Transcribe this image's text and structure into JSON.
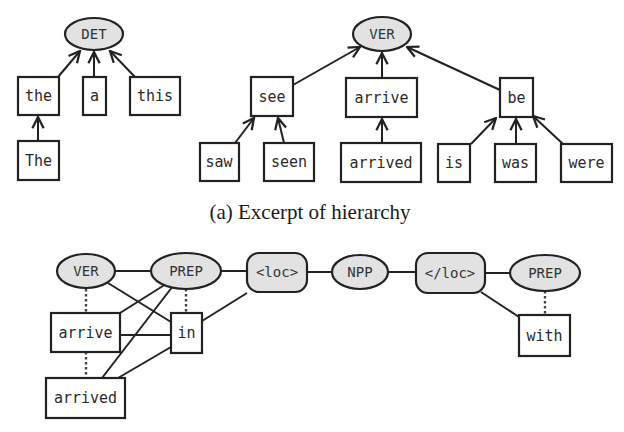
{
  "figure": {
    "part_a": {
      "caption": "(a) Excerpt of hierarchy",
      "categories": [
        {
          "label": "DET",
          "children": [
            {
              "label": "the",
              "children": [
                {
                  "label": "The"
                }
              ]
            },
            {
              "label": "a",
              "children": []
            },
            {
              "label": "this",
              "children": []
            }
          ]
        },
        {
          "label": "VER",
          "children": [
            {
              "label": "see",
              "children": [
                {
                  "label": "saw"
                },
                {
                  "label": "seen"
                }
              ]
            },
            {
              "label": "arrive",
              "children": [
                {
                  "label": "arrived"
                }
              ]
            },
            {
              "label": "be",
              "children": [
                {
                  "label": "is"
                },
                {
                  "label": "was"
                },
                {
                  "label": "were"
                }
              ]
            }
          ]
        }
      ]
    },
    "part_b": {
      "sequence": [
        {
          "label": "VER",
          "shape": "ellipse"
        },
        {
          "label": "PREP",
          "shape": "ellipse"
        },
        {
          "label": "<loc>",
          "shape": "rounded-rect"
        },
        {
          "label": "NPP",
          "shape": "ellipse"
        },
        {
          "label": "</loc>",
          "shape": "rounded-rect"
        },
        {
          "label": "PREP",
          "shape": "ellipse"
        }
      ],
      "words": [
        {
          "label": "arrive"
        },
        {
          "label": "in"
        },
        {
          "label": "arrived"
        },
        {
          "label": "with"
        }
      ]
    }
  }
}
